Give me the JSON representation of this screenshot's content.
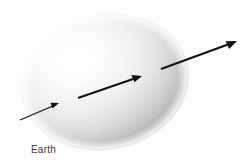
{
  "figure": {
    "title": "",
    "background_color": "#fdfdfd",
    "earth": {
      "label": "Earth",
      "shape": "sphere-ellipse",
      "highlight_color": "#ffffff",
      "midtone_color": "#e6e6e6",
      "shadow_color": "#9e9e9e",
      "center_x": 105,
      "center_y": 82,
      "radius_x": 83,
      "radius_y": 66,
      "rotation_deg": -12,
      "highlight_offset": "35% 30%"
    },
    "arrows": {
      "color": "#111111",
      "count": 3,
      "description": "three parallel arrows of increasing length pointing up and to the right",
      "items": [
        {
          "name": "arrow-short",
          "x1": 20,
          "y1": 120,
          "x2": 59,
          "y2": 103,
          "stroke_width": 1.2,
          "head_size": 7
        },
        {
          "name": "arrow-medium",
          "x1": 78,
          "y1": 98,
          "x2": 142,
          "y2": 76,
          "stroke_width": 1.8,
          "head_size": 9
        },
        {
          "name": "arrow-long",
          "x1": 161,
          "y1": 69,
          "x2": 237,
          "y2": 41,
          "stroke_width": 2.0,
          "head_size": 10
        }
      ]
    }
  }
}
